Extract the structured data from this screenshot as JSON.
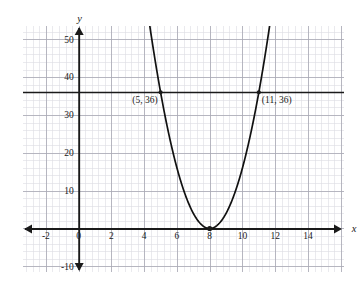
{
  "figure": {
    "kind": "cartesian-graph",
    "background": "#ffffff",
    "ink_color": "#1a1a1a",
    "curve_color": "#111111",
    "grid_minor_color": "#dcdce2",
    "grid_major_color": "#a8a8b4"
  },
  "axes": {
    "x_axis_label": "x",
    "y_axis_label": "y",
    "x_ticks": [
      {
        "value": -2,
        "label": "-2"
      },
      {
        "value": 0,
        "label": "0"
      },
      {
        "value": 2,
        "label": "2"
      },
      {
        "value": 4,
        "label": "4"
      },
      {
        "value": 6,
        "label": "6"
      },
      {
        "value": 8,
        "label": "8"
      },
      {
        "value": 10,
        "label": "10"
      },
      {
        "value": 12,
        "label": "12"
      },
      {
        "value": 14,
        "label": "14"
      }
    ],
    "y_ticks": [
      {
        "value": 50,
        "label": "50"
      },
      {
        "value": 40,
        "label": "40"
      },
      {
        "value": 30,
        "label": "30"
      },
      {
        "value": 20,
        "label": "20"
      },
      {
        "value": 10,
        "label": "10"
      },
      {
        "value": -10,
        "label": "-10"
      }
    ],
    "x_range": [
      -3.4,
      16.2
    ],
    "y_range": [
      -11.5,
      53.5
    ],
    "x_minor_step": 0.4,
    "y_minor_step": 2,
    "x_major_step": 2,
    "y_major_step": 10,
    "grid": true,
    "arrow_ends": [
      "x-left",
      "x-right",
      "y-up",
      "y-down"
    ]
  },
  "chart_data": {
    "type": "line",
    "title": "",
    "xlabel": "x",
    "ylabel": "y",
    "xlim": [
      -3.4,
      16.2
    ],
    "ylim": [
      -11.5,
      53.5
    ],
    "grid": true,
    "legend_position": "none",
    "series": [
      {
        "name": "parabola",
        "kind": "parabola",
        "equation": "y = 4(x - 8)^2",
        "vertex": [
          8,
          0
        ],
        "a": 4,
        "x": [
          4.6,
          5,
          5.5,
          6,
          6.5,
          7,
          7.5,
          8,
          8.5,
          9,
          9.5,
          10,
          10.5,
          11,
          11.4
        ],
        "values": [
          46.24,
          36,
          25,
          16,
          9,
          4,
          1,
          0,
          1,
          4,
          9,
          16,
          25,
          36,
          46.24
        ]
      },
      {
        "name": "horizontal-line-y-36",
        "kind": "horizontal-line",
        "equation": "y = 36",
        "y": 36
      }
    ],
    "points": [
      {
        "label": "(5, 36)",
        "x": 5,
        "y": 36,
        "marker": "dot",
        "label_anchor": "left-below"
      },
      {
        "label": "(11, 36)",
        "x": 11,
        "y": 36,
        "marker": "dot",
        "label_anchor": "right-below"
      },
      {
        "label": "",
        "x": 8,
        "y": 0,
        "marker": "dot",
        "label_anchor": "none"
      }
    ],
    "annotations": [
      {
        "text": "(5, 36)",
        "x": 5,
        "y": 36
      },
      {
        "text": "(11, 36)",
        "x": 11,
        "y": 36
      }
    ]
  }
}
